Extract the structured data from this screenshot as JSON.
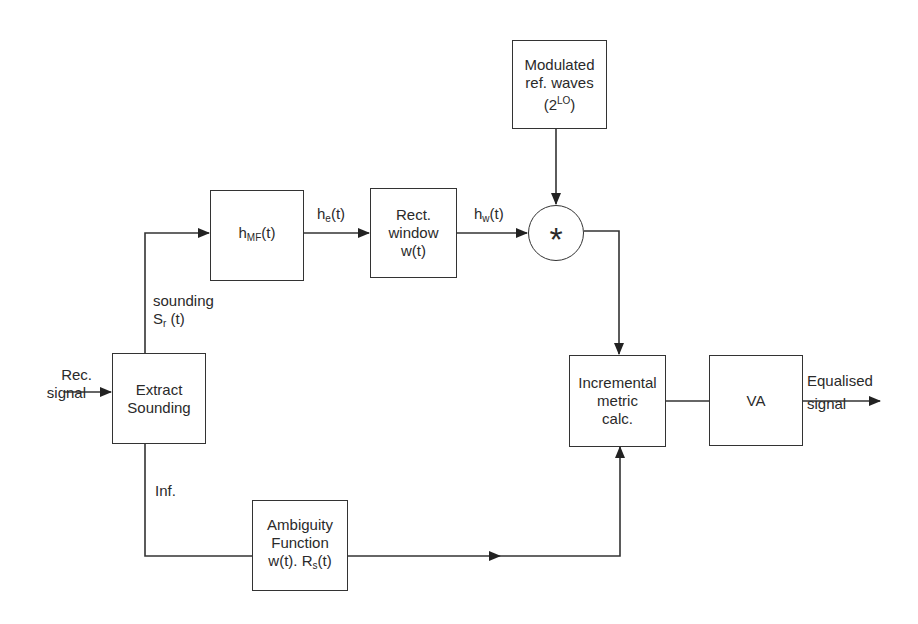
{
  "blocks": {
    "modulated": {
      "line1": "Modulated",
      "line2": "ref. waves",
      "line3_base": "(2",
      "line3_sup": "LO",
      "line3_end": ")"
    },
    "hmf": {
      "base": "h",
      "sub": "MF",
      "end": "(t)"
    },
    "rect_window": {
      "line1": "Rect.",
      "line2": "window",
      "line3": "w(t)"
    },
    "convolution": {
      "symbol": "*"
    },
    "extract": {
      "line1": "Extract",
      "line2": "Sounding"
    },
    "ambiguity": {
      "line1": "Ambiguity",
      "line2": "Function",
      "line3_a": "w(t). R",
      "line3_sub": "s",
      "line3_b": "(t)"
    },
    "incremental": {
      "line1": "Incremental",
      "line2": "metric",
      "line3": "calc."
    },
    "va": {
      "label": "VA"
    }
  },
  "signals": {
    "input": {
      "line1": "Rec.",
      "line2": "signal"
    },
    "he": {
      "base": "h",
      "sub": "e",
      "end": "(t)"
    },
    "hw": {
      "base": "h",
      "sub": "w",
      "end": "(t)"
    },
    "sounding": {
      "line1": "sounding",
      "base": "S",
      "sub": "r",
      "end": " (t)"
    },
    "inf": {
      "label": "Inf."
    },
    "output": {
      "line1": "Equalised",
      "line2": "signal"
    }
  },
  "colors": {
    "stroke": "#333333",
    "text": "#2a2a2a",
    "background": "#ffffff"
  }
}
